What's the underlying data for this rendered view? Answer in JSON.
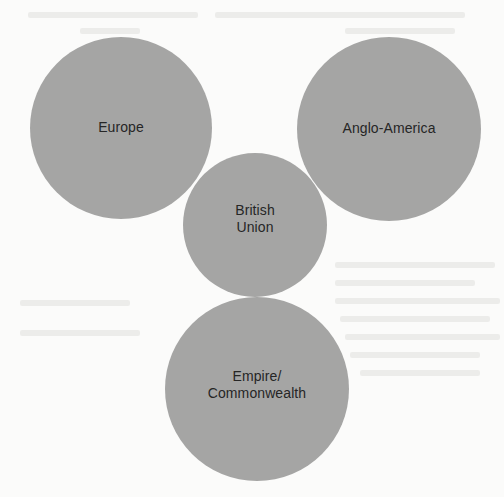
{
  "diagram": {
    "type": "overlapping-circles",
    "colors": {
      "background": "#fbfbfa",
      "circle_fill": "#a5a5a4",
      "label_text": "#262626"
    },
    "circles": [
      {
        "id": "europe",
        "label": "Europe",
        "cx": 121,
        "cy": 128,
        "r": 91
      },
      {
        "id": "anglo-america",
        "label": "Anglo-America",
        "cx": 389,
        "cy": 129,
        "r": 92
      },
      {
        "id": "british-union",
        "label": "British\nUnion",
        "cx": 255,
        "cy": 225,
        "r": 72
      },
      {
        "id": "empire-commonwealth",
        "label": "Empire/\nCommonwealth",
        "cx": 257,
        "cy": 389,
        "r": 92
      }
    ]
  }
}
